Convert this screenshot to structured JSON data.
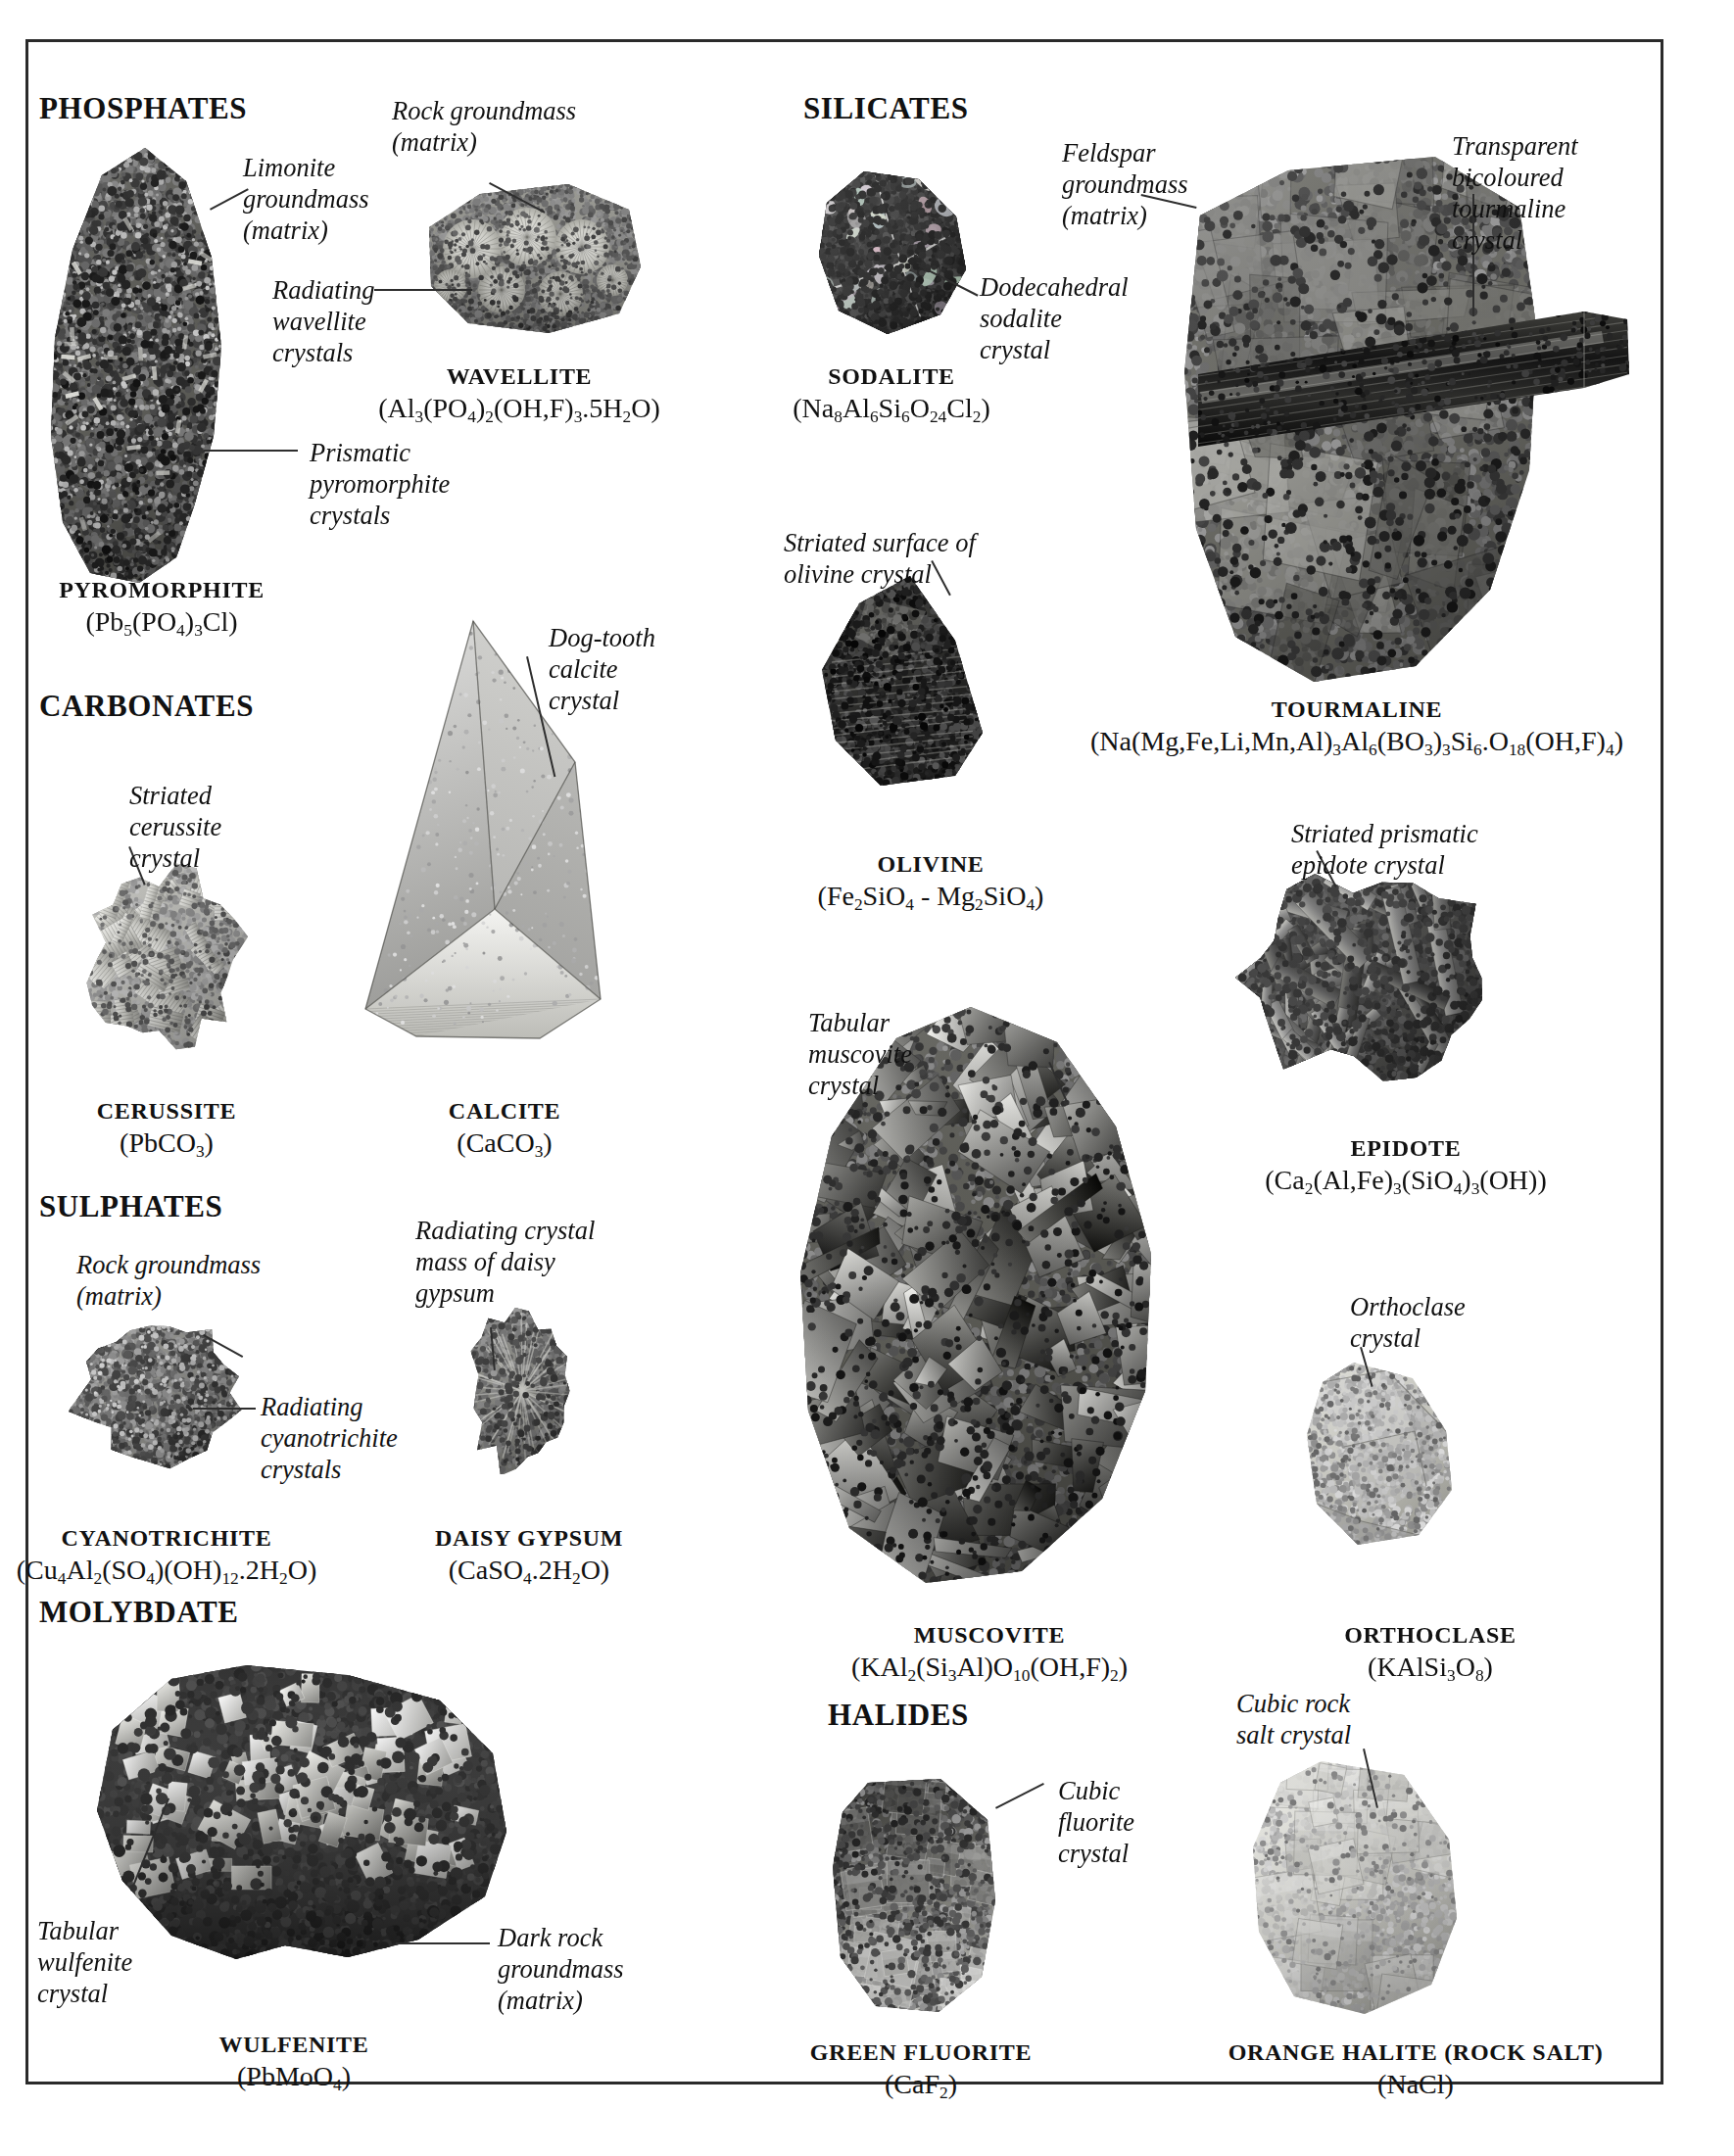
{
  "page": {
    "sections": [
      {
        "id": "phosphates",
        "label": "PHOSPHATES"
      },
      {
        "id": "carbonates",
        "label": "CARBONATES"
      },
      {
        "id": "sulphates",
        "label": "SULPHATES"
      },
      {
        "id": "molybdate",
        "label": "MOLYBDATE"
      },
      {
        "id": "silicates",
        "label": "SILICATES"
      },
      {
        "id": "halides",
        "label": "HALIDES"
      }
    ],
    "specimens": [
      {
        "id": "pyromorphite",
        "name": "PYROMORPHITE",
        "formula": "(Pb5(PO4)3Cl)"
      },
      {
        "id": "wavellite",
        "name": "WAVELLITE",
        "formula": "(Al3(PO4)2(OH,F)3.5H2O)"
      },
      {
        "id": "cerussite",
        "name": "CERUSSITE",
        "formula": "(PbCO3)"
      },
      {
        "id": "calcite",
        "name": "CALCITE",
        "formula": "(CaCO3)"
      },
      {
        "id": "cyanotrichite",
        "name": "CYANOTRICHITE",
        "formula": "(Cu4Al2(SO4)(OH)12.2H2O)"
      },
      {
        "id": "daisy-gypsum",
        "name": "DAISY GYPSUM",
        "formula": "(CaSO4.2H2O)"
      },
      {
        "id": "wulfenite",
        "name": "WULFENITE",
        "formula": "(PbMoO4)"
      },
      {
        "id": "sodalite",
        "name": "SODALITE",
        "formula": "(Na8Al6Si6O24Cl2)"
      },
      {
        "id": "tourmaline",
        "name": "TOURMALINE",
        "formula": "(Na(Mg,Fe,Li,Mn,Al)3Al6(BO3)3Si6.O18(OH,F)4)"
      },
      {
        "id": "olivine",
        "name": "OLIVINE",
        "formula": "(Fe2SiO4 - Mg2SiO4)"
      },
      {
        "id": "epidote",
        "name": "EPIDOTE",
        "formula": "(Ca2(Al,Fe)3(SiO4)3(OH))"
      },
      {
        "id": "muscovite",
        "name": "MUSCOVITE",
        "formula": "(KAl2(Si3Al)O10(OH,F)2)"
      },
      {
        "id": "orthoclase",
        "name": "ORTHOCLASE",
        "formula": "(KAlSi3O8)"
      },
      {
        "id": "green-fluorite",
        "name": "GREEN FLUORITE",
        "formula": "(CaF2)"
      },
      {
        "id": "orange-halite",
        "name": "ORANGE HALITE (ROCK SALT)",
        "formula": "(NaCl)"
      }
    ],
    "annotations": [
      {
        "id": "limonite-groundmass",
        "text": "Limonite\ngroundmass\n(matrix)"
      },
      {
        "id": "prismatic-pyromorphite",
        "text": "Prismatic\npyromorphite\ncrystals"
      },
      {
        "id": "rock-groundmass-wavellite",
        "text": "Rock groundmass\n(matrix)"
      },
      {
        "id": "radiating-wavellite",
        "text": "Radiating\nwavellite\ncrystals"
      },
      {
        "id": "striated-cerussite",
        "text": "Striated\ncerussite\ncrystal"
      },
      {
        "id": "dog-tooth-calcite",
        "text": "Dog-tooth\ncalcite\ncrystal"
      },
      {
        "id": "rock-groundmass-cyanotrichite",
        "text": "Rock groundmass\n(matrix)"
      },
      {
        "id": "radiating-cyanotrichite",
        "text": "Radiating\ncyanotrichite\ncrystals"
      },
      {
        "id": "radiating-daisy-gypsum",
        "text": "Radiating crystal\nmass of daisy\ngypsum"
      },
      {
        "id": "tabular-wulfenite",
        "text": "Tabular\nwulfenite\ncrystal"
      },
      {
        "id": "dark-rock-groundmass",
        "text": "Dark rock\ngroundmass\n(matrix)"
      },
      {
        "id": "feldspar-groundmass",
        "text": "Feldspar\ngroundmass\n(matrix)"
      },
      {
        "id": "dodecahedral-sodalite",
        "text": "Dodecahedral\nsodalite\ncrystal"
      },
      {
        "id": "transparent-tourmaline",
        "text": "Transparent\nbicoloured\ntourmaline\ncrystal"
      },
      {
        "id": "striated-olivine",
        "text": "Striated surface of\nolivine crystal"
      },
      {
        "id": "striated-epidote",
        "text": "Striated prismatic\nepidote crystal"
      },
      {
        "id": "tabular-muscovite",
        "text": "Tabular\nmuscovite\ncrystal"
      },
      {
        "id": "orthoclase-crystal",
        "text": "Orthoclase\ncrystal"
      },
      {
        "id": "cubic-fluorite",
        "text": "Cubic\nfluorite\ncrystal"
      },
      {
        "id": "cubic-rock-salt",
        "text": "Cubic rock\nsalt crystal"
      }
    ]
  }
}
